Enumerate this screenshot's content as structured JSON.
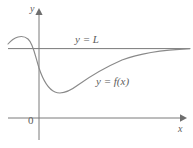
{
  "figure": {
    "type": "math-graph",
    "background_color": "#ffffff",
    "axis_color": "#7a7a7a",
    "curve_color": "#8a8a8a",
    "label_color": "#5d5d5d"
  },
  "axes": {
    "y_axis_label": "y",
    "x_axis_label": "x",
    "origin_label": "0"
  },
  "annotations": {
    "asymptote_label": "y = L",
    "curve_label": "y = f(x)"
  },
  "chart_data": {
    "type": "line",
    "title": "",
    "xlabel": "x",
    "ylabel": "y",
    "grid": false,
    "legend": "none",
    "annotations": [
      {
        "text": "y = L",
        "x": 75,
        "y": 34,
        "kind": "asymptote-label"
      },
      {
        "text": "y = f(x)",
        "x": 96,
        "y": 76,
        "kind": "curve-label"
      }
    ],
    "series": [
      {
        "name": "y = f(x)",
        "path": "M 8 44 C 14 37, 22 34, 28 39 C 33 43, 35 55, 39 68 C 43 80, 48 89, 55 92 C 62 95, 70 91, 78 85 C 92 75, 106 67, 122 60 C 140 53, 160 50, 190 48.6"
      },
      {
        "name": "y = L (horizontal asymptote)",
        "path": "M 8 48.6 L 190 48.6"
      }
    ]
  }
}
